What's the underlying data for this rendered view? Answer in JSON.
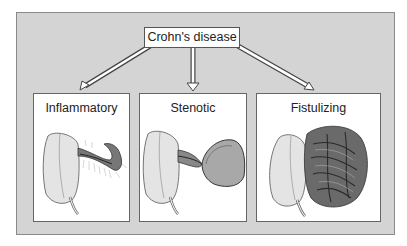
{
  "diagram": {
    "root": {
      "label": "Crohn's disease"
    },
    "branches": [
      {
        "label": "Inflammatory",
        "illustration": "inflamed-bowel-icon"
      },
      {
        "label": "Stenotic",
        "illustration": "stenotic-bowel-icon"
      },
      {
        "label": "Fistulizing",
        "illustration": "fistulizing-bowel-icon"
      }
    ]
  },
  "colors": {
    "background": "#d4d4d4",
    "panel": "#ffffff",
    "border": "#666666",
    "organ_fill": "#e4e4e4",
    "tissue_dark": "#5a5a5a"
  }
}
